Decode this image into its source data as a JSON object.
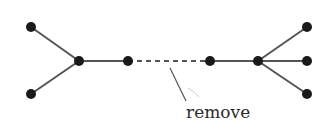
{
  "diagram": {
    "type": "tree-graph",
    "nodes": [
      {
        "id": "leaf-top-left",
        "x": 31,
        "y": 27
      },
      {
        "id": "leaf-bottom-left",
        "x": 31,
        "y": 94
      },
      {
        "id": "hub-left",
        "x": 79,
        "y": 61
      },
      {
        "id": "node-mid-left",
        "x": 128,
        "y": 61
      },
      {
        "id": "node-mid-right",
        "x": 210,
        "y": 61
      },
      {
        "id": "hub-right",
        "x": 258,
        "y": 61
      },
      {
        "id": "leaf-top-right",
        "x": 307,
        "y": 27
      },
      {
        "id": "leaf-mid-right",
        "x": 307,
        "y": 61
      },
      {
        "id": "leaf-bottom-right",
        "x": 307,
        "y": 94
      }
    ],
    "edges": [
      {
        "from": "leaf-top-left",
        "to": "hub-left",
        "style": "solid"
      },
      {
        "from": "leaf-bottom-left",
        "to": "hub-left",
        "style": "solid"
      },
      {
        "from": "hub-left",
        "to": "node-mid-left",
        "style": "solid"
      },
      {
        "from": "node-mid-left",
        "to": "node-mid-right",
        "style": "dashed"
      },
      {
        "from": "node-mid-right",
        "to": "hub-right",
        "style": "solid"
      },
      {
        "from": "hub-right",
        "to": "leaf-top-right",
        "style": "solid"
      },
      {
        "from": "hub-right",
        "to": "leaf-mid-right",
        "style": "solid"
      },
      {
        "from": "hub-right",
        "to": "leaf-bottom-right",
        "style": "solid"
      }
    ],
    "annotation": {
      "text": "remove",
      "points_to": "dashed edge"
    },
    "colors": {
      "node": "#1a1a1a",
      "edge": "#555555",
      "text": "#2a2a2a"
    }
  }
}
